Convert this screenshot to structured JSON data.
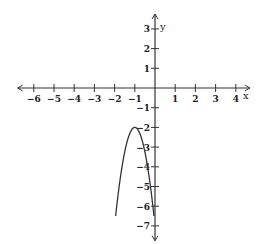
{
  "chart_data": {
    "type": "line",
    "title": "",
    "xlabel": "x",
    "ylabel": "y",
    "xlim": [
      -6.5,
      4.5
    ],
    "ylim": [
      -7.5,
      3.5
    ],
    "x_ticks": [
      -6,
      -5,
      -4,
      -3,
      -2,
      -1,
      1,
      2,
      3,
      4
    ],
    "x_tick_labels": [
      "-6",
      "-5",
      "-4",
      "-3",
      "-2",
      "-1",
      "1",
      "2",
      "3",
      "4"
    ],
    "y_ticks": [
      3,
      2,
      1,
      -1,
      -2,
      -3,
      -4,
      -5,
      -6,
      -7
    ],
    "y_tick_labels": [
      "3",
      "2",
      "1",
      "-1",
      "-2",
      "-3",
      "-4",
      "-5",
      "-6",
      "-7"
    ],
    "grid": false,
    "legend": null,
    "series": [
      {
        "name": "parabola",
        "description": "Downward-opening parabola with vertex at (-1, -2)",
        "vertex": [
          -1,
          -2
        ],
        "x": [
          -1.95,
          -1.8,
          -1.6,
          -1.4,
          -1.2,
          -1.0,
          -0.8,
          -0.6,
          -0.4,
          -0.2,
          -0.05
        ],
        "y": [
          -6.5,
          -5.2,
          -3.8,
          -2.8,
          -2.2,
          -2.0,
          -2.2,
          -2.8,
          -3.8,
          -5.2,
          -6.5
        ]
      }
    ]
  },
  "labels": {
    "x_axis": "x",
    "y_axis": "y"
  }
}
